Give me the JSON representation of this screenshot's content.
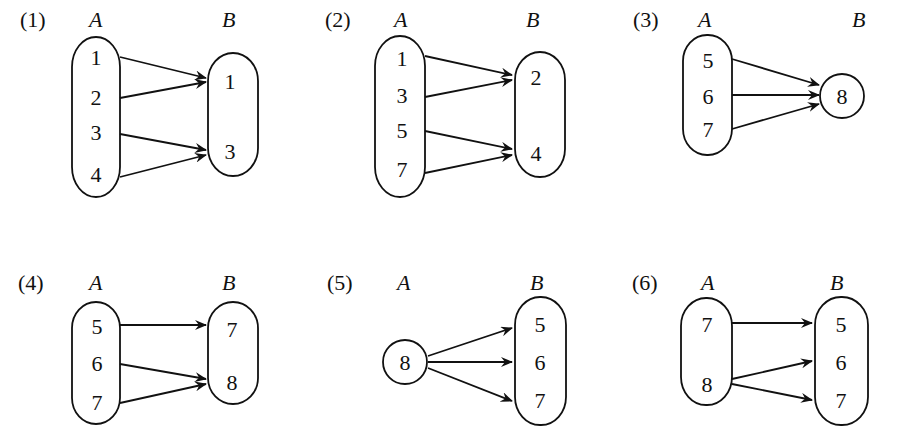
{
  "diagrams": [
    {
      "label": "(1)",
      "set_a": "A",
      "set_b": "B",
      "a_elements": [
        "1",
        "2",
        "3",
        "4"
      ],
      "b_elements": [
        "1",
        "3"
      ],
      "mappings": [
        [
          "1",
          "1"
        ],
        [
          "2",
          "1"
        ],
        [
          "3",
          "3"
        ],
        [
          "4",
          "3"
        ]
      ]
    },
    {
      "label": "(2)",
      "set_a": "A",
      "set_b": "B",
      "a_elements": [
        "1",
        "3",
        "5",
        "7"
      ],
      "b_elements": [
        "2",
        "4"
      ],
      "mappings": [
        [
          "1",
          "2"
        ],
        [
          "3",
          "2"
        ],
        [
          "5",
          "4"
        ],
        [
          "7",
          "4"
        ]
      ]
    },
    {
      "label": "(3)",
      "set_a": "A",
      "set_b": "B",
      "a_elements": [
        "5",
        "6",
        "7"
      ],
      "b_elements": [
        "8"
      ],
      "mappings": [
        [
          "5",
          "8"
        ],
        [
          "6",
          "8"
        ],
        [
          "7",
          "8"
        ]
      ]
    },
    {
      "label": "(4)",
      "set_a": "A",
      "set_b": "B",
      "a_elements": [
        "5",
        "6",
        "7"
      ],
      "b_elements": [
        "7",
        "8"
      ],
      "mappings": [
        [
          "5",
          "7"
        ],
        [
          "6",
          "8"
        ],
        [
          "7",
          "8"
        ]
      ]
    },
    {
      "label": "(5)",
      "set_a": "A",
      "set_b": "B",
      "a_elements": [
        "8"
      ],
      "b_elements": [
        "5",
        "6",
        "7"
      ],
      "mappings": [
        [
          "8",
          "5"
        ],
        [
          "8",
          "6"
        ],
        [
          "8",
          "7"
        ]
      ]
    },
    {
      "label": "(6)",
      "set_a": "A",
      "set_b": "B",
      "a_elements": [
        "7",
        "8"
      ],
      "b_elements": [
        "5",
        "6",
        "7"
      ],
      "mappings": [
        [
          "7",
          "5"
        ],
        [
          "8",
          "6"
        ],
        [
          "8",
          "7"
        ]
      ]
    }
  ]
}
